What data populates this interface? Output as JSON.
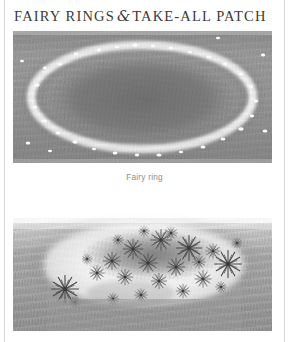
{
  "page": {
    "background_color": "#ffffff",
    "rule_color": "#d9d9d9"
  },
  "title": {
    "part1": "FAIRY RINGS",
    "ampersand": "&",
    "part2": "TAKE-ALL PATCH",
    "color": "#3a3a3a"
  },
  "figures": [
    {
      "name": "fairy-ring",
      "alt": "Grayscale pencil illustration of a lawn with an elliptical fairy ring: a dark inner grass zone bounded by a pale ring band studded with small white mushrooms.",
      "caption": "Fairy ring",
      "caption_color": "#8d8d8d",
      "grass_tone": "#9b9b9b",
      "ring_band_tone": "#efefef",
      "inner_tone": "#7e7e7e",
      "mushroom_color": "#fdfdfd",
      "mushroom_count": 34
    },
    {
      "name": "take-all-patch",
      "alt": "Grayscale pencil illustration of a lawn showing a sunken take-all patch: a pale bleached circular depression filled with dark star-shaped weed rosettes, surrounded by healthy grass.",
      "caption": "",
      "grass_tone": "#a6a6a6",
      "patch_tone": "#f4f4f4",
      "weed_tone": "#555555",
      "weed_count": 24
    }
  ]
}
